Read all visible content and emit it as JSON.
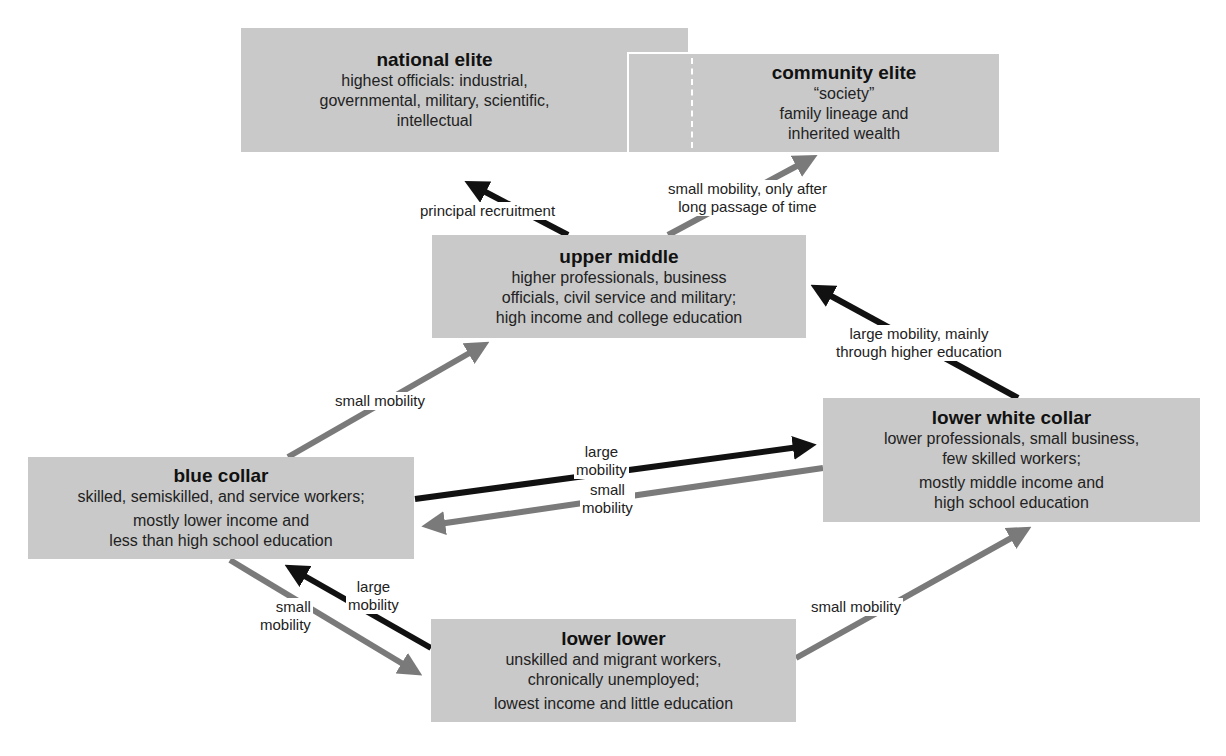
{
  "colors": {
    "box_fill": "#c9c9c9",
    "large_arrow": "#111111",
    "small_arrow": "#7a7a7a",
    "background": "#ffffff"
  },
  "boxes": {
    "national_elite": {
      "title": "national elite",
      "lines": [
        "highest officials: industrial,",
        "governmental, military, scientific,",
        "intellectual"
      ]
    },
    "community_elite": {
      "title": "community elite",
      "lines": [
        "“society”",
        "family lineage and",
        "inherited wealth"
      ]
    },
    "upper_middle": {
      "title": "upper middle",
      "lines": [
        "higher professionals, business",
        "officials, civil service and military;",
        "high income and college education"
      ]
    },
    "lower_white_collar": {
      "title": "lower white collar",
      "lines": [
        "lower professionals, small business,",
        "few skilled workers;",
        "mostly middle income and",
        "high school education"
      ]
    },
    "blue_collar": {
      "title": "blue collar",
      "lines": [
        "skilled, semiskilled, and service workers;",
        "mostly lower income and",
        "less than high school education"
      ]
    },
    "lower_lower": {
      "title": "lower lower",
      "lines": [
        "unskilled and migrant workers,",
        "chronically unemployed;",
        "lowest income and little education"
      ]
    }
  },
  "arrow_labels": {
    "upper_to_national": "principal recruitment",
    "upper_to_community": [
      "small mobility, only after",
      "long passage of time"
    ],
    "lwc_to_upper": [
      "large mobility, mainly",
      "through higher education"
    ],
    "blue_to_upper": "small mobility",
    "blue_to_lwc": [
      "large",
      "mobility"
    ],
    "lwc_to_blue": [
      "small",
      "mobility"
    ],
    "lower_to_blue": [
      "large",
      "mobility"
    ],
    "blue_to_lower": [
      "small",
      "mobility"
    ],
    "lower_to_lwc": "small mobility"
  }
}
